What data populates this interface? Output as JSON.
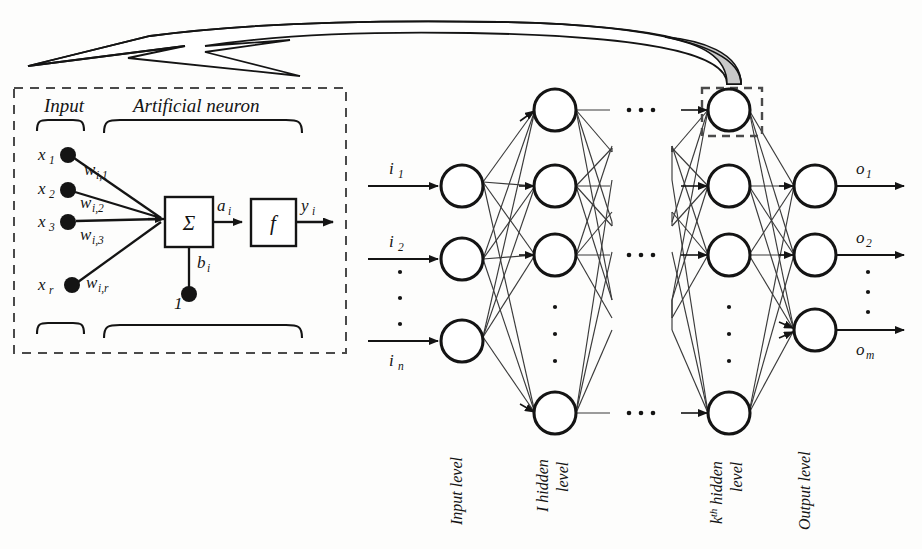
{
  "figure": {
    "type": "diagram",
    "background_color": "#fdfdfc",
    "ink_color": "#141414",
    "callout_fill": "#c9c9c9"
  },
  "detail_panel": {
    "border_style": "dashed",
    "headers": {
      "input": "Input",
      "neuron": "Artificial neuron"
    },
    "inputs": [
      {
        "signal": "x",
        "signal_sub": "1",
        "weight": "w",
        "weight_sub": "i,1"
      },
      {
        "signal": "x",
        "signal_sub": "2",
        "weight": "w",
        "weight_sub": "i,2"
      },
      {
        "signal": "x",
        "signal_sub": "3",
        "weight": "w",
        "weight_sub": "i,3"
      },
      {
        "signal": "x",
        "signal_sub": "r",
        "weight": "w",
        "weight_sub": "i,r"
      }
    ],
    "sum_box": {
      "symbol": "Σ",
      "name": "summation"
    },
    "activation_box": {
      "symbol": "f",
      "name": "activation-function"
    },
    "net_input": {
      "label": "a",
      "sub": "i"
    },
    "output": {
      "label": "y",
      "sub": "i"
    },
    "bias": {
      "label": "b",
      "sub": "i",
      "constant": "1"
    }
  },
  "network": {
    "input_layer": {
      "level_label": "Input level",
      "labels": [
        {
          "text": "i",
          "sub": "1"
        },
        {
          "text": "i",
          "sub": "2"
        },
        {
          "text": "i",
          "sub": "n"
        }
      ],
      "node_count_shown": 3,
      "vertical_ellipsis": true
    },
    "first_hidden_layer": {
      "level_label_line1": "I hidden",
      "level_label_line2": "level",
      "node_count_shown": 4,
      "vertical_ellipsis": true
    },
    "kth_hidden_layer": {
      "level_label_line1": "k",
      "level_label_sup": "th",
      "level_label_line1b": " hidden",
      "level_label_line2": "level",
      "node_count_shown": 4,
      "vertical_ellipsis": true,
      "highlighted_node_index": 0
    },
    "output_layer": {
      "level_label": "Output level",
      "labels": [
        {
          "text": "o",
          "sub": "1"
        },
        {
          "text": "o",
          "sub": "2"
        },
        {
          "text": "o",
          "sub": "m"
        }
      ],
      "node_count_shown": 3,
      "vertical_ellipsis": true
    },
    "horizontal_ellipsis_count": 3,
    "horizontal_ellipsis_label": "..."
  }
}
